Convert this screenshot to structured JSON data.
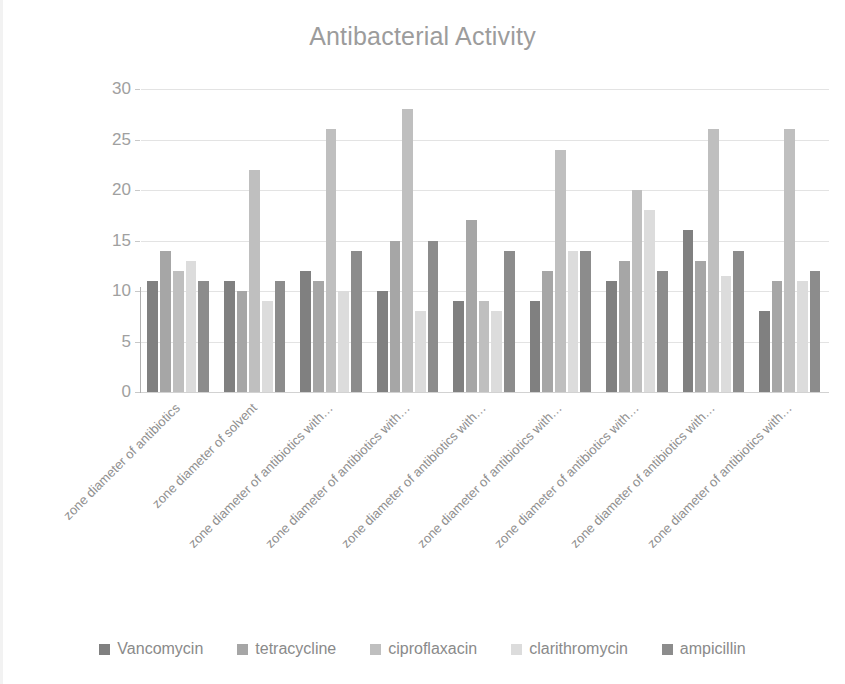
{
  "chart_data": {
    "type": "bar",
    "title": "Antibacterial Activity",
    "xlabel": "",
    "ylabel": "",
    "ylim": [
      0,
      30
    ],
    "ytick_step": 5,
    "yticks": [
      0,
      5,
      10,
      15,
      20,
      25,
      30
    ],
    "grid": true,
    "legend_position": "bottom",
    "categories": [
      "zone diameter of antibiotics",
      "zone diameter of solvent",
      "zone diameter of antibiotics with…",
      "zone diameter of antibiotics with…",
      "zone diameter of antibiotics with…",
      "zone diameter of antibiotics with…",
      "zone diameter of antibiotics with…",
      "zone diameter of antibiotics with…",
      "zone diameter of antibiotics with…"
    ],
    "series": [
      {
        "name": "Vancomycin",
        "color": "#808080",
        "values": [
          11,
          11,
          12,
          10,
          9,
          9,
          11,
          16,
          8
        ]
      },
      {
        "name": "tetracycline",
        "color": "#a6a6a6",
        "values": [
          14,
          10,
          11,
          15,
          17,
          12,
          13,
          13,
          11
        ]
      },
      {
        "name": "ciproflaxacin",
        "color": "#bfbfbf",
        "values": [
          12,
          22,
          26,
          28,
          9,
          24,
          20,
          26,
          26
        ]
      },
      {
        "name": "clarithromycin",
        "color": "#dcdcdc",
        "values": [
          13,
          9,
          10,
          8,
          8,
          14,
          18,
          11.5,
          11
        ]
      },
      {
        "name": "ampicillin",
        "color": "#8c8c8c",
        "values": [
          11,
          11,
          14,
          15,
          14,
          14,
          12,
          14,
          12
        ]
      }
    ]
  },
  "colors": {
    "title": "#9c9c9c",
    "axis_text": "#a0a0a0",
    "gridline": "#e3e3e3",
    "legend_text": "#8a8a8a",
    "background": "#ffffff"
  }
}
